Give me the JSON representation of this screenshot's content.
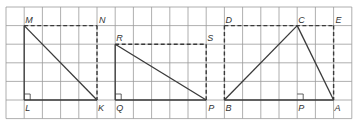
{
  "grid": {
    "x0": 6,
    "y0": 7,
    "cell_w": 18.2,
    "cell_h": 18.6,
    "cols": 19,
    "rows": 6,
    "line_color": "#9a9a9a"
  },
  "figures": [
    {
      "name": "triangle-MLK",
      "points": {
        "M": [
          1,
          1
        ],
        "N": [
          5,
          1
        ],
        "L": [
          1,
          5
        ],
        "K": [
          5,
          5
        ]
      },
      "solid": [
        [
          "M",
          "L"
        ],
        [
          "L",
          "K"
        ],
        [
          "M",
          "K"
        ]
      ],
      "dashed": [
        [
          "M",
          "N"
        ],
        [
          "N",
          "K"
        ]
      ],
      "right_angle": "L",
      "right_angle_dir": [
        1,
        -1
      ],
      "labels": [
        {
          "text": "M",
          "at": "M",
          "dx": 1,
          "dy": -3
        },
        {
          "text": "N",
          "at": "N",
          "dx": 2,
          "dy": -3
        },
        {
          "text": "L",
          "at": "L",
          "dx": 1,
          "dy": 11
        },
        {
          "text": "K",
          "at": "K",
          "dx": 1,
          "dy": 11
        }
      ]
    },
    {
      "name": "triangle-RQP",
      "points": {
        "R": [
          6,
          2
        ],
        "S": [
          11,
          2
        ],
        "Q": [
          6,
          5
        ],
        "P": [
          11,
          5
        ]
      },
      "solid": [
        [
          "R",
          "Q"
        ],
        [
          "Q",
          "P"
        ],
        [
          "R",
          "P"
        ]
      ],
      "dashed": [
        [
          "R",
          "S"
        ],
        [
          "S",
          "P"
        ]
      ],
      "right_angle": "Q",
      "right_angle_dir": [
        1,
        -1
      ],
      "labels": [
        {
          "text": "R",
          "at": "R",
          "dx": 1,
          "dy": -3
        },
        {
          "text": "S",
          "at": "S",
          "dx": 1,
          "dy": -3
        },
        {
          "text": "Q",
          "at": "Q",
          "dx": 1,
          "dy": 11
        },
        {
          "text": "P",
          "at": "P",
          "dx": 2,
          "dy": 11
        }
      ]
    },
    {
      "name": "triangle-ABC",
      "points": {
        "D": [
          12,
          1
        ],
        "C": [
          16,
          1
        ],
        "E": [
          18,
          1
        ],
        "B": [
          12,
          5
        ],
        "P": [
          16,
          5
        ],
        "A": [
          18,
          5
        ]
      },
      "solid": [
        [
          "B",
          "A"
        ],
        [
          "B",
          "C"
        ],
        [
          "C",
          "A"
        ]
      ],
      "dashed": [
        [
          "D",
          "E"
        ],
        [
          "D",
          "B"
        ],
        [
          "E",
          "A"
        ]
      ],
      "right_angle": "P",
      "right_angle_dir": [
        1,
        -1
      ],
      "labels": [
        {
          "text": "D",
          "at": "D",
          "dx": 1,
          "dy": -3
        },
        {
          "text": "C",
          "at": "C",
          "dx": 1,
          "dy": -3
        },
        {
          "text": "E",
          "at": "E",
          "dx": 2,
          "dy": -3
        },
        {
          "text": "B",
          "at": "B",
          "dx": 1,
          "dy": 11
        },
        {
          "text": "P",
          "at": "P",
          "dx": 1,
          "dy": 11
        },
        {
          "text": "A",
          "at": "A",
          "dx": 1,
          "dy": 11
        }
      ]
    }
  ]
}
